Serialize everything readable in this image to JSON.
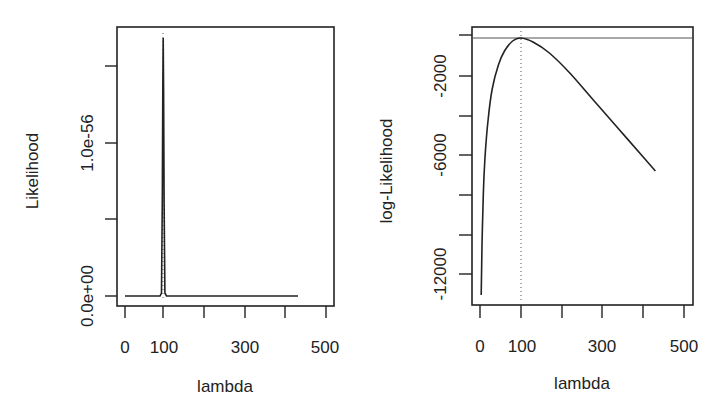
{
  "chart_data": [
    {
      "type": "line",
      "panel": "left",
      "title": "",
      "xlabel": "lambda",
      "ylabel": "Likelihood",
      "xlim": [
        0,
        520
      ],
      "ylim": [
        0,
        1.5e-56
      ],
      "x_ticks": [
        0,
        100,
        200,
        300,
        400,
        500
      ],
      "x_tick_labels": [
        "0",
        "100",
        "",
        "300",
        "",
        "500"
      ],
      "y_ticks": [
        0,
        5e-57,
        1e-56,
        1.5e-56
      ],
      "y_tick_labels": [
        "0.0e+00",
        "",
        "1.0e-56",
        ""
      ],
      "grid": false,
      "annotations": [
        {
          "type": "vline",
          "x": 100,
          "style": "dotted"
        }
      ],
      "series": [
        {
          "name": "Likelihood",
          "x": [
            1,
            90,
            96,
            98,
            99,
            100,
            101,
            102,
            104,
            110,
            430
          ],
          "values": [
            0,
            0,
            1e-58,
            8e-57,
            1.3e-56,
            1.68e-56,
            1.3e-56,
            8e-57,
            1e-58,
            0,
            0
          ]
        }
      ]
    },
    {
      "type": "line",
      "panel": "right",
      "title": "",
      "xlabel": "lambda",
      "ylabel": "log-Likelihood",
      "xlim": [
        0,
        520
      ],
      "ylim": [
        -13500,
        300
      ],
      "x_ticks": [
        0,
        100,
        200,
        300,
        400,
        500
      ],
      "x_tick_labels": [
        "0",
        "100",
        "",
        "300",
        "",
        "500"
      ],
      "y_ticks": [
        0,
        -2000,
        -4000,
        -6000,
        -8000,
        -10000,
        -12000
      ],
      "y_tick_labels": [
        "",
        "-2000",
        "",
        "-6000",
        "",
        "",
        "-12000"
      ],
      "grid": false,
      "annotations": [
        {
          "type": "vline",
          "x": 100,
          "style": "dotted"
        },
        {
          "type": "hline",
          "y": -150,
          "style": "solid"
        }
      ],
      "series": [
        {
          "name": "log-Likelihood",
          "x": [
            3,
            5,
            8,
            12,
            20,
            30,
            45,
            60,
            80,
            100,
            130,
            170,
            220,
            280,
            340,
            400,
            430
          ],
          "values": [
            -13000,
            -10500,
            -8000,
            -6200,
            -4200,
            -2700,
            -1500,
            -800,
            -300,
            -150,
            -350,
            -900,
            -1900,
            -3300,
            -4700,
            -6100,
            -6800
          ]
        }
      ]
    }
  ],
  "left": {
    "xlabel": "lambda",
    "ylabel": "Likelihood",
    "x_tick_labels": [
      "0",
      "100",
      "300",
      "500"
    ],
    "y_tick_labels": [
      "0.0e+00",
      "1.0e-56"
    ]
  },
  "right": {
    "xlabel": "lambda",
    "ylabel": "log-Likelihood",
    "x_tick_labels": [
      "0",
      "100",
      "300",
      "500"
    ],
    "y_tick_labels": [
      "-2000",
      "-6000",
      "-12000"
    ]
  }
}
